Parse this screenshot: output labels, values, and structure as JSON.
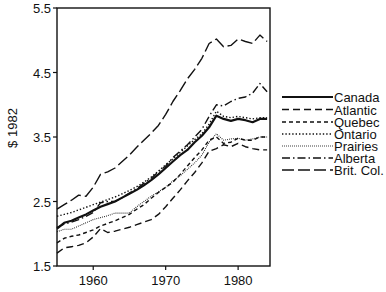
{
  "chart_data": {
    "type": "line",
    "title": "",
    "xlabel": "",
    "ylabel": "$ 1982",
    "xlim": [
      1955,
      1984.4
    ],
    "ylim": [
      1.5,
      5.5
    ],
    "xticks": [
      1960,
      1970,
      1980
    ],
    "xtick_labels": [
      "1960",
      "1970",
      "1980"
    ],
    "yticks": [
      1.5,
      2.5,
      3.5,
      4.5,
      5.5
    ],
    "ytick_labels": [
      "1.5",
      "2.5",
      "3.5",
      "4.5",
      "5.5"
    ],
    "grid": false,
    "legend_position": "right",
    "x": [
      1955,
      1956,
      1957,
      1958,
      1959,
      1960,
      1961,
      1962,
      1963,
      1964,
      1965,
      1966,
      1967,
      1968,
      1969,
      1970,
      1971,
      1972,
      1973,
      1974,
      1975,
      1976,
      1977,
      1978,
      1979,
      1980,
      1981,
      1982,
      1983,
      1984
    ],
    "series": [
      {
        "name": "Canada",
        "style": "solid",
        "width": 2.2,
        "values": [
          2.08,
          2.17,
          2.2,
          2.25,
          2.3,
          2.36,
          2.42,
          2.46,
          2.5,
          2.56,
          2.62,
          2.68,
          2.75,
          2.83,
          2.92,
          3.02,
          3.12,
          3.22,
          3.3,
          3.42,
          3.52,
          3.65,
          3.83,
          3.78,
          3.75,
          3.78,
          3.76,
          3.73,
          3.78,
          3.78
        ]
      },
      {
        "name": "Atlantic",
        "style": "dash-long",
        "width": 1.4,
        "values": [
          1.7,
          1.78,
          1.8,
          1.82,
          1.86,
          1.95,
          2.08,
          2.02,
          2.04,
          2.07,
          2.1,
          2.14,
          2.18,
          2.22,
          2.3,
          2.42,
          2.55,
          2.68,
          2.82,
          2.95,
          3.1,
          3.28,
          3.32,
          3.38,
          3.35,
          3.4,
          3.35,
          3.32,
          3.3,
          3.3
        ]
      },
      {
        "name": "Quebec",
        "style": "dash-short",
        "width": 1.4,
        "values": [
          1.86,
          1.93,
          1.96,
          1.98,
          2.02,
          2.06,
          2.12,
          2.16,
          2.2,
          2.25,
          2.3,
          2.38,
          2.45,
          2.55,
          2.64,
          2.72,
          2.8,
          2.92,
          3.05,
          3.18,
          3.3,
          3.45,
          3.5,
          3.4,
          3.42,
          3.48,
          3.45,
          3.45,
          3.5,
          3.5
        ]
      },
      {
        "name": "Ontario",
        "style": "dotted",
        "width": 1.4,
        "values": [
          2.27,
          2.3,
          2.33,
          2.37,
          2.41,
          2.45,
          2.49,
          2.53,
          2.57,
          2.62,
          2.67,
          2.73,
          2.8,
          2.88,
          2.97,
          3.07,
          3.16,
          3.26,
          3.36,
          3.46,
          3.55,
          3.7,
          3.9,
          3.82,
          3.8,
          3.82,
          3.8,
          3.78,
          3.8,
          3.8
        ]
      },
      {
        "name": "Prairies",
        "style": "fine-dotted",
        "width": 1.1,
        "values": [
          2.03,
          2.07,
          2.07,
          2.12,
          2.17,
          2.22,
          2.25,
          2.28,
          2.32,
          2.32,
          2.32,
          2.42,
          2.5,
          2.58,
          2.65,
          2.72,
          2.82,
          2.9,
          3.0,
          3.1,
          3.22,
          3.42,
          3.55,
          3.45,
          3.47,
          3.48,
          3.45,
          3.47,
          3.5,
          3.5
        ]
      },
      {
        "name": "Alberta",
        "style": "dash-dot",
        "width": 1.4,
        "values": [
          2.1,
          2.15,
          2.18,
          2.22,
          2.27,
          2.33,
          2.48,
          2.5,
          2.5,
          2.56,
          2.63,
          2.7,
          2.78,
          2.86,
          2.96,
          3.05,
          3.18,
          3.28,
          3.38,
          3.5,
          3.62,
          3.82,
          4.0,
          3.98,
          4.05,
          4.1,
          4.12,
          4.18,
          4.33,
          4.2
        ]
      },
      {
        "name": "Brit. Col.",
        "style": "dash-xlong",
        "width": 1.4,
        "values": [
          2.38,
          2.45,
          2.52,
          2.6,
          2.58,
          2.72,
          2.92,
          2.96,
          3.02,
          3.12,
          3.22,
          3.34,
          3.45,
          3.56,
          3.68,
          3.85,
          4.05,
          4.22,
          4.4,
          4.55,
          4.72,
          4.95,
          5.02,
          4.9,
          4.92,
          5.02,
          4.98,
          4.95,
          5.08,
          4.98
        ]
      }
    ]
  },
  "legend": {
    "items": [
      {
        "label": "Canada"
      },
      {
        "label": "Atlantic"
      },
      {
        "label": "Quebec"
      },
      {
        "label": "Ontario"
      },
      {
        "label": "Prairies"
      },
      {
        "label": "Alberta"
      },
      {
        "label": "Brit. Col."
      }
    ]
  },
  "axes": {
    "ylabel": "$ 1982"
  }
}
